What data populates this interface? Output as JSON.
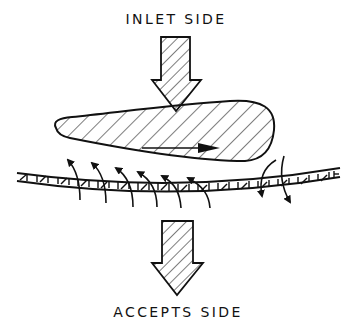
{
  "diagram": {
    "top_label": "INLET SIDE",
    "bottom_label": "ACCEPTS SIDE",
    "elements": [
      {
        "name": "inlet-flow-arrow",
        "type": "hatched-down-arrow",
        "position": "top"
      },
      {
        "name": "foil-blade",
        "type": "hatched-teardrop",
        "motion": "rightward arrow inside"
      },
      {
        "name": "screen-plate",
        "type": "hatched perforated strip, slightly curved"
      },
      {
        "name": "backflush-arrows",
        "count": 6,
        "direction": "upward through screen (under leading part of foil)"
      },
      {
        "name": "forward-flow-arrows",
        "count": 2,
        "direction": "downward through screen (behind foil tip)"
      },
      {
        "name": "accepts-flow-arrow",
        "type": "hatched-down-arrow",
        "position": "bottom"
      }
    ],
    "colors": {
      "ink": "#111111",
      "background": "#ffffff"
    }
  }
}
